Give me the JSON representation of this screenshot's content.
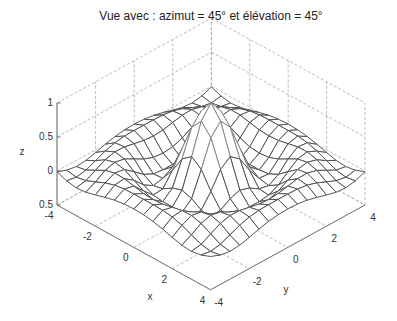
{
  "chart_data": {
    "type": "surface3d",
    "title": "Vue avec : azimut = 45° et élévation = 45°",
    "xlabel": "x",
    "ylabel": "y",
    "zlabel": "z",
    "view": {
      "azimuth": 45,
      "elevation": 45
    },
    "xlim": [
      -4,
      4
    ],
    "ylim": [
      -4,
      4
    ],
    "zlim": [
      -0.5,
      1
    ],
    "x_ticks": [
      "-4",
      "-2",
      "0",
      "2",
      "4"
    ],
    "y_ticks": [
      "-4",
      "-2",
      "0",
      "2",
      "4"
    ],
    "z_ticks": [
      "0.5",
      "0",
      "0.5",
      "1"
    ],
    "z_tick_values": [
      -0.5,
      0,
      0.5,
      1
    ],
    "function": "sin(r)/r, r = sqrt(x^2 + y^2)",
    "grid": {
      "x": [
        -4,
        4,
        0.5
      ],
      "y": [
        -4,
        4,
        0.5
      ]
    },
    "surface_style": "mesh",
    "mesh_color": "#555555",
    "grid_lines": "dashed",
    "peak": {
      "x": 0,
      "y": 0,
      "z": 1
    }
  }
}
